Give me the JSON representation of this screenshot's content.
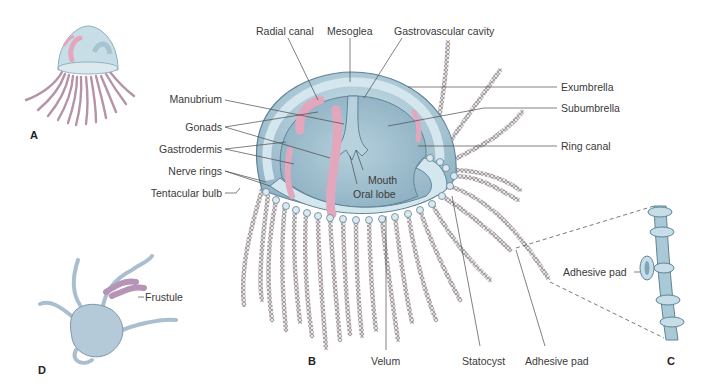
{
  "figure": {
    "panels": {
      "A": "A",
      "B": "B",
      "C": "C",
      "D": "D"
    },
    "labels": {
      "radial_canal": "Radial canal",
      "mesoglea": "Mesoglea",
      "gastrovascular_cavity": "Gastrovascular cavity",
      "exumbrella": "Exumbrella",
      "subumbrella": "Subumbrella",
      "ring_canal": "Ring canal",
      "manubrium": "Manubrium",
      "gonads": "Gonads",
      "gastrodermis": "Gastrodermis",
      "nerve_rings": "Nerve rings",
      "tentacular_bulb": "Tentacular bulb",
      "mouth": "Mouth",
      "oral_lobe": "Oral lobe",
      "velum": "Velum",
      "statocyst": "Statocyst",
      "adhesive_pad_b": "Adhesive pad",
      "adhesive_pad_c": "Adhesive pad",
      "frustule": "Frustule"
    },
    "colors": {
      "body": "#a9c9d6",
      "body_dark": "#7fa6b8",
      "mesoglea": "#d4e6ee",
      "gonad": "#e3a7bd",
      "tentacle": "#8a7f86",
      "tentacle_a": "#b593a8",
      "leader_line": "#4a4a4a",
      "text": "#3a3a3a"
    }
  }
}
